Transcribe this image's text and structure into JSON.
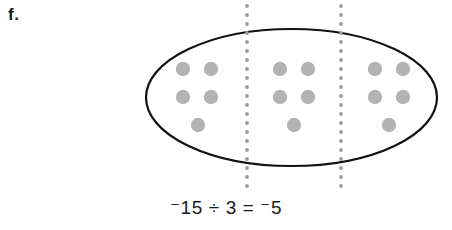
{
  "part": {
    "label": "f."
  },
  "equation": {
    "text": "⁻15 ÷ 3 = ⁻5",
    "dividend": "-15",
    "divisor": "3",
    "quotient": "-5",
    "operator_divide": "÷",
    "operator_equals": "="
  },
  "colors": {
    "dot_fill": "#b3b3b3",
    "ellipse_stroke": "#111111",
    "divider_dots": "#9a9a9a",
    "text": "#1a1a1a",
    "background": "#ffffff"
  },
  "diagram": {
    "type": "grouping-model",
    "total_counters": 15,
    "group_count": 3,
    "counters_per_group": 5,
    "counter_value": -1,
    "ellipse": {
      "cx": 291.5,
      "cy": 97.5,
      "rx": 145.5,
      "ry": 68.5,
      "stroke_width": 2.2
    },
    "dividers": [
      {
        "name": "divider-1",
        "x": 247,
        "y_top": 6,
        "y_bottom": 189
      },
      {
        "name": "divider-2",
        "x": 341,
        "y_top": 6,
        "y_bottom": 189
      }
    ],
    "divider_dot_radius": 1.9,
    "divider_dot_spacing": 9,
    "counter_radius": 7.2,
    "groups": [
      {
        "name": "group-1",
        "count": 5,
        "dots": [
          {
            "cx": 183,
            "cy": 69
          },
          {
            "cx": 211,
            "cy": 69
          },
          {
            "cx": 183,
            "cy": 97
          },
          {
            "cx": 211,
            "cy": 97
          },
          {
            "cx": 198,
            "cy": 125
          }
        ]
      },
      {
        "name": "group-2",
        "count": 5,
        "dots": [
          {
            "cx": 280,
            "cy": 69
          },
          {
            "cx": 308,
            "cy": 69
          },
          {
            "cx": 280,
            "cy": 97
          },
          {
            "cx": 308,
            "cy": 97
          },
          {
            "cx": 294,
            "cy": 125
          }
        ]
      },
      {
        "name": "group-3",
        "count": 5,
        "dots": [
          {
            "cx": 375,
            "cy": 69
          },
          {
            "cx": 403,
            "cy": 69
          },
          {
            "cx": 375,
            "cy": 97
          },
          {
            "cx": 403,
            "cy": 97
          },
          {
            "cx": 389,
            "cy": 125
          }
        ]
      }
    ]
  }
}
